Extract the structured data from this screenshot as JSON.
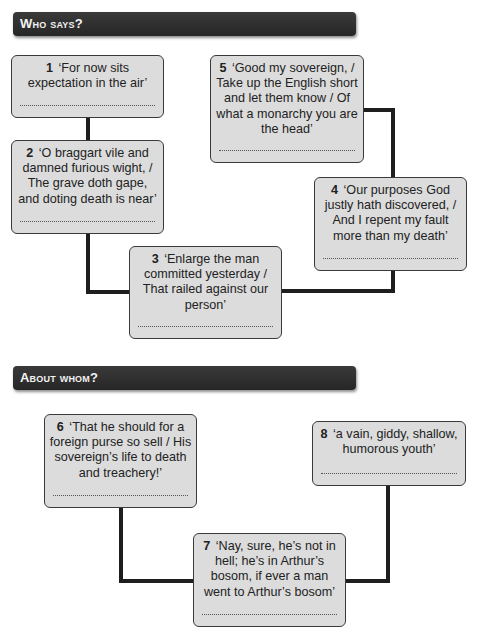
{
  "sections": [
    {
      "title": "Who says?"
    },
    {
      "title": "About whom?"
    }
  ],
  "boxes": [
    {
      "number": "1",
      "quote": "‘For now sits expectation in the air’",
      "answer": ""
    },
    {
      "number": "2",
      "quote": "‘O braggart vile and damned furious wight, / The grave doth gape, and doting death is near’",
      "answer": ""
    },
    {
      "number": "3",
      "quote": "‘Enlarge the man committed yesterday / That railed against our person’",
      "answer": ""
    },
    {
      "number": "4",
      "quote": "‘Our purposes God justly hath discovered, / And I repent my fault more than my death’",
      "answer": ""
    },
    {
      "number": "5",
      "quote": "‘Good my sovereign, / Take up the English short and let them know / Of what a monarchy you are the head’",
      "answer": ""
    },
    {
      "number": "6",
      "quote": "‘That he should for a foreign purse so sell / His sovereign’s life to death and treachery!’",
      "answer": ""
    },
    {
      "number": "7",
      "quote": "‘Nay, sure, he’s not in hell; he’s in Arthur’s bosom, if ever a man went to Arthur’s bosom’",
      "answer": ""
    },
    {
      "number": "8",
      "quote": "‘a vain, giddy, shallow, humorous youth’",
      "answer": ""
    }
  ],
  "colors": {
    "banner": "#2e2e2e",
    "box_fill": "#dcdcdc",
    "connector": "#1e1e1e"
  }
}
